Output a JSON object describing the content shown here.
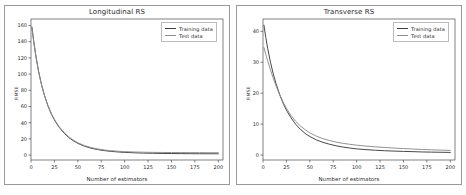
{
  "figure": {
    "background": "#ffffff",
    "panel_border_color": "#9a9a9a"
  },
  "colors": {
    "training": "#3d3d3d",
    "test": "#8c8c8c",
    "axis": "#4a4a4a",
    "text": "#2b2b2b"
  },
  "legend": {
    "training_label": "Training data",
    "test_label": "Test data"
  },
  "chart_data": [
    {
      "type": "line",
      "panel": "left",
      "title": "Longitudinal RS",
      "xlabel": "Number of estimators",
      "ylabel": "RMSE",
      "xlim": [
        0,
        205
      ],
      "ylim": [
        -6,
        168
      ],
      "xticks": [
        0,
        25,
        50,
        75,
        100,
        125,
        150,
        175,
        200
      ],
      "xtick_labels": [
        "0",
        "25",
        "50",
        "75",
        "100",
        "125",
        "150",
        "175",
        "200"
      ],
      "yticks": [
        0,
        20,
        40,
        60,
        80,
        100,
        120,
        140,
        160
      ],
      "ytick_labels": [
        "0",
        "20",
        "40",
        "60",
        "80",
        "100",
        "120",
        "140",
        "160"
      ],
      "grid": false,
      "legend_position": "upper right",
      "x": [
        1,
        3,
        5,
        8,
        11,
        14,
        18,
        22,
        26,
        30,
        35,
        40,
        45,
        50,
        57,
        64,
        71,
        78,
        85,
        92,
        100,
        110,
        120,
        130,
        140,
        150,
        160,
        170,
        180,
        190,
        200
      ],
      "series": [
        {
          "name": "Training data",
          "color": "#3d3d3d",
          "values": [
            158.0,
            140.0,
            124.0,
            104.0,
            88.0,
            75.0,
            61.0,
            50.0,
            41.5,
            34.5,
            27.5,
            22.0,
            17.8,
            14.5,
            11.0,
            8.6,
            6.9,
            5.6,
            4.7,
            4.0,
            3.4,
            2.9,
            2.5,
            2.3,
            2.1,
            2.0,
            1.9,
            1.8,
            1.75,
            1.7,
            1.65
          ]
        },
        {
          "name": "Test data",
          "color": "#8c8c8c",
          "values": [
            156.5,
            139.0,
            123.5,
            103.5,
            88.0,
            75.2,
            61.5,
            50.6,
            42.2,
            35.2,
            28.3,
            22.8,
            18.6,
            15.3,
            11.8,
            9.4,
            7.7,
            6.4,
            5.5,
            4.9,
            4.3,
            3.9,
            3.6,
            3.4,
            3.3,
            3.2,
            3.15,
            3.1,
            3.05,
            3.0,
            3.0
          ]
        }
      ]
    },
    {
      "type": "line",
      "panel": "right",
      "title": "Transverse RS",
      "xlabel": "Number of estimators",
      "ylabel": "RMSE",
      "xlim": [
        0,
        205
      ],
      "ylim": [
        -1.6,
        44
      ],
      "xticks": [
        0,
        25,
        50,
        75,
        100,
        125,
        150,
        175,
        200
      ],
      "xtick_labels": [
        "0",
        "25",
        "50",
        "75",
        "100",
        "125",
        "150",
        "175",
        "200"
      ],
      "yticks": [
        0,
        10,
        20,
        30,
        40
      ],
      "ytick_labels": [
        "0",
        "10",
        "20",
        "30",
        "40"
      ],
      "grid": false,
      "legend_position": "upper right",
      "x": [
        1,
        3,
        5,
        8,
        11,
        14,
        18,
        22,
        26,
        30,
        35,
        40,
        45,
        50,
        57,
        64,
        71,
        78,
        85,
        92,
        100,
        110,
        120,
        130,
        140,
        150,
        160,
        170,
        180,
        190,
        200
      ],
      "series": [
        {
          "name": "Training data",
          "color": "#3d3d3d",
          "values": [
            42.0,
            38.0,
            34.5,
            30.0,
            26.2,
            23.0,
            19.4,
            16.4,
            14.0,
            12.0,
            9.9,
            8.3,
            7.0,
            6.0,
            4.9,
            4.1,
            3.5,
            3.0,
            2.6,
            2.3,
            2.0,
            1.75,
            1.55,
            1.4,
            1.28,
            1.18,
            1.1,
            1.0,
            0.95,
            0.9,
            0.85
          ]
        },
        {
          "name": "Test data",
          "color": "#8c8c8c",
          "values": [
            34.8,
            32.5,
            30.5,
            27.5,
            24.8,
            22.3,
            19.3,
            16.8,
            14.6,
            12.8,
            10.9,
            9.4,
            8.2,
            7.2,
            6.1,
            5.3,
            4.7,
            4.2,
            3.8,
            3.5,
            3.2,
            2.9,
            2.65,
            2.45,
            2.25,
            2.1,
            1.95,
            1.8,
            1.7,
            1.6,
            1.5
          ]
        }
      ]
    }
  ]
}
